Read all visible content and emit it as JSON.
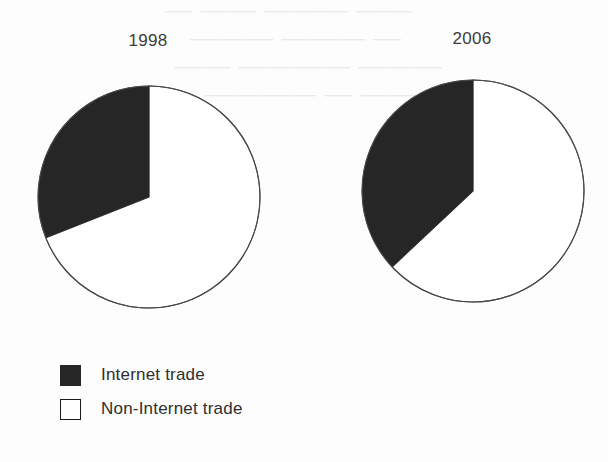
{
  "figure": {
    "background_color": "#fdfdfd",
    "ink_color": "#2f2f2f",
    "series_colors": {
      "internet_trade": "#262626",
      "non_internet_trade": "#ffffff"
    },
    "outline_color": "#4a4a4a",
    "bleed_text": {
      "line1": "—  ——  ———   ——",
      "line2": "———   ———  —",
      "line3": "——  ————   ———",
      "line4": "————  —  ——"
    }
  },
  "legend": {
    "items": [
      {
        "label": "Internet trade",
        "swatch": "filled",
        "color": "#262626"
      },
      {
        "label": "Non-Internet trade",
        "swatch": "empty",
        "color": "#ffffff"
      }
    ]
  },
  "chart_data": [
    {
      "type": "pie",
      "title": "1998",
      "categories": [
        "Internet trade",
        "Non-Internet trade"
      ],
      "values": [
        31,
        69
      ],
      "value_unit": "percent",
      "start_angle_deg": 90,
      "direction": "counterclockwise",
      "wedge_angles_deg": [
        113,
        247
      ],
      "colors": [
        "#262626",
        "#ffffff"
      ],
      "center_px": [
        148,
        196
      ],
      "radius_px": 111,
      "legend_position": "bottom-left",
      "grid": false
    },
    {
      "type": "pie",
      "title": "2006",
      "categories": [
        "Internet trade",
        "Non-Internet trade"
      ],
      "values": [
        37,
        63
      ],
      "value_unit": "percent",
      "start_angle_deg": 90,
      "direction": "counterclockwise",
      "wedge_angles_deg": [
        133,
        227
      ],
      "colors": [
        "#262626",
        "#ffffff"
      ],
      "center_px": [
        472,
        190
      ],
      "radius_px": 111,
      "legend_position": "bottom-left",
      "grid": false
    }
  ]
}
